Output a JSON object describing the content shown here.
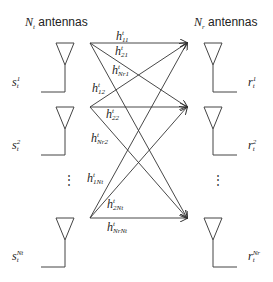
{
  "diagram": {
    "type": "MIMO channel diagram",
    "tx_header": {
      "symbol": "N",
      "sub": "t",
      "text": " antennas"
    },
    "rx_header": {
      "symbol": "N",
      "sub": "r",
      "text": " antennas"
    },
    "tx_antennas": [
      {
        "base": "s",
        "sup": "1",
        "sub": "t"
      },
      {
        "base": "s",
        "sup": "2",
        "sub": "t"
      },
      {
        "base": "s",
        "sup": "Nt",
        "sub": "t"
      }
    ],
    "rx_antennas": [
      {
        "base": "r",
        "sup": "1",
        "sub": "t"
      },
      {
        "base": "r",
        "sup": "2",
        "sub": "t"
      },
      {
        "base": "r",
        "sup": "Nr",
        "sub": "t"
      }
    ],
    "ellipsis": "⋮",
    "channel_labels": [
      {
        "base": "h",
        "sup": "t",
        "sub": "11"
      },
      {
        "base": "h",
        "sup": "t",
        "sub": "21"
      },
      {
        "base": "h",
        "sup": "t",
        "sub": "Nr1"
      },
      {
        "base": "h",
        "sup": "t",
        "sub": "12"
      },
      {
        "base": "h",
        "sup": "t",
        "sub": "22"
      },
      {
        "base": "h",
        "sup": "t",
        "sub": "Nr2"
      },
      {
        "base": "h",
        "sup": "t",
        "sub": "1Nt"
      },
      {
        "base": "h",
        "sup": "t",
        "sub": "2Nt"
      },
      {
        "base": "h",
        "sup": "t",
        "sub": "NrNt"
      }
    ]
  }
}
